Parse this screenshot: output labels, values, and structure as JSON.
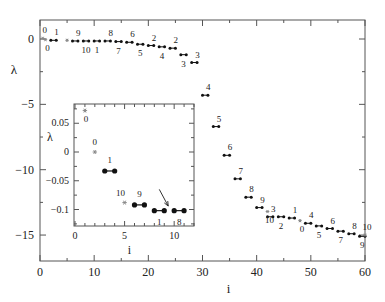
{
  "chart_data": [
    {
      "type": "scatter",
      "title": "",
      "xlabel": "i",
      "ylabel": "λ",
      "xlim": [
        0,
        60
      ],
      "ylim": [
        -17,
        1.5
      ],
      "x_ticks": [
        0,
        10,
        20,
        30,
        40,
        50,
        60
      ],
      "y_ticks": [
        0,
        -5,
        -10,
        -15
      ],
      "grid": false,
      "legend": null,
      "series": [
        {
          "name": "paired eigenvalues",
          "style": "black dumbbell pairs",
          "pairs": [
            {
              "x": [
                2,
                3
              ],
              "y": -0.1,
              "label": "1",
              "label_pos": "above"
            },
            {
              "x": [
                6,
                7
              ],
              "y": -0.15,
              "label": "9",
              "label_pos": "above"
            },
            {
              "x": [
                8,
                9
              ],
              "y": -0.15,
              "label": "10",
              "label_pos": "below"
            },
            {
              "x": [
                10,
                11
              ],
              "y": -0.15,
              "label": "1",
              "label_pos": "below"
            },
            {
              "x": [
                12,
                13
              ],
              "y": -0.15,
              "label": "8",
              "label_pos": "above"
            },
            {
              "x": [
                14,
                15
              ],
              "y": -0.2,
              "label": "7",
              "label_pos": "below"
            },
            {
              "x": [
                16,
                17
              ],
              "y": -0.25,
              "label": "6",
              "label_pos": "above"
            },
            {
              "x": [
                18,
                19
              ],
              "y": -0.4,
              "label": "5",
              "label_pos": "below"
            },
            {
              "x": [
                20,
                21
              ],
              "y": -0.5,
              "label": "2",
              "label_pos": "above"
            },
            {
              "x": [
                22,
                23
              ],
              "y": -0.6,
              "label": "4",
              "label_pos": "below"
            },
            {
              "x": [
                24,
                25
              ],
              "y": -0.7,
              "label": "2",
              "label_pos": "above"
            },
            {
              "x": [
                26,
                27
              ],
              "y": -1.2,
              "label": "3",
              "label_pos": "below"
            },
            {
              "x": [
                28,
                29
              ],
              "y": -1.8,
              "label": "3",
              "label_pos": "above"
            },
            {
              "x": [
                30,
                31
              ],
              "y": -4.3,
              "label": "4",
              "label_pos": "above"
            },
            {
              "x": [
                32,
                33
              ],
              "y": -6.7,
              "label": "5",
              "label_pos": "above"
            },
            {
              "x": [
                34,
                35
              ],
              "y": -8.9,
              "label": "6",
              "label_pos": "above"
            },
            {
              "x": [
                36,
                37
              ],
              "y": -10.7,
              "label": "7",
              "label_pos": "above"
            },
            {
              "x": [
                38,
                39
              ],
              "y": -12.1,
              "label": "8",
              "label_pos": "above"
            },
            {
              "x": [
                40,
                41
              ],
              "y": -12.9,
              "label": "9",
              "label_pos": "above"
            },
            {
              "x": [
                42,
                43
              ],
              "y": -13.6,
              "label": "3",
              "label_pos": "above"
            },
            {
              "x": [
                44,
                45
              ],
              "y": -13.6,
              "label": "2",
              "label_pos": "below"
            },
            {
              "x": [
                46,
                47
              ],
              "y": -13.7,
              "label": "1",
              "label_pos": "above"
            },
            {
              "x": [
                49,
                50
              ],
              "y": -14.1,
              "label": "4",
              "label_pos": "above"
            },
            {
              "x": [
                51,
                52
              ],
              "y": -14.3,
              "label": "5",
              "label_pos": "below"
            },
            {
              "x": [
                53,
                54
              ],
              "y": -14.5,
              "label": "6",
              "label_pos": "above"
            },
            {
              "x": [
                55,
                56
              ],
              "y": -14.7,
              "label": "7",
              "label_pos": "below"
            },
            {
              "x": [
                57,
                58
              ],
              "y": -14.9,
              "label": "8",
              "label_pos": "above"
            },
            {
              "x": [
                59,
                60
              ],
              "y": -15.1,
              "label": "9",
              "label_pos": "below"
            }
          ]
        },
        {
          "name": "single eigenvalues",
          "style": "gray star",
          "points": [
            {
              "x": 0.5,
              "y": 0.05,
              "label": "0",
              "label_pos": "above"
            },
            {
              "x": 1,
              "y": -0.05,
              "label": "0",
              "label_pos": "below"
            },
            {
              "x": 5,
              "y": -0.1,
              "label": "",
              "label_pos": "none"
            },
            {
              "x": 42,
              "y": -13.2,
              "label": "10",
              "label_pos": "below"
            },
            {
              "x": 48,
              "y": -13.9,
              "label": "0",
              "label_pos": "below"
            },
            {
              "x": 60,
              "y": -15.0,
              "label": "10",
              "label_pos": "above"
            }
          ]
        }
      ],
      "inset": {
        "type": "scatter",
        "xlabel": "i",
        "ylabel": "λ",
        "xlim": [
          0,
          12
        ],
        "ylim": [
          -0.128,
          0.085
        ],
        "x_ticks": [
          0,
          5,
          10
        ],
        "y_ticks": [
          0.05,
          0,
          -0.05,
          -0.1
        ],
        "y_tick_labels": [
          "0.05",
          "0",
          "−0.05",
          "−0.1"
        ],
        "single_points": [
          {
            "x": 1,
            "y": 0.072,
            "label": "0",
            "label_pos": "below-right"
          },
          {
            "x": 2,
            "y": 0.0,
            "label": "0",
            "label_pos": "above"
          },
          {
            "x": 5,
            "y": -0.088,
            "label": "10",
            "label_pos": "above"
          }
        ],
        "pairs": [
          {
            "x": [
              3,
              4
            ],
            "y": -0.033,
            "label": "1",
            "label_pos": "above"
          },
          {
            "x": [
              6,
              7
            ],
            "y": -0.092,
            "label": "9",
            "label_pos": "above"
          },
          {
            "x": [
              8,
              9
            ],
            "y": -0.102,
            "label": "1",
            "label_pos": "below"
          },
          {
            "x": [
              10,
              11
            ],
            "y": -0.102,
            "label": "8",
            "label_pos": "below"
          }
        ],
        "annotation": {
          "type": "arrow",
          "from": [
            8.5,
            -0.065
          ],
          "to": [
            9.4,
            -0.094
          ]
        }
      }
    }
  ],
  "axes": {
    "main_xlabel": "i",
    "main_ylabel": "λ",
    "main_x_tick_labels": [
      "0",
      "10",
      "20",
      "30",
      "40",
      "50",
      "60"
    ],
    "main_y_tick_labels": [
      "0",
      "−5",
      "−10",
      "−15"
    ],
    "inset_xlabel": "i",
    "inset_ylabel": "λ",
    "inset_x_tick_labels": [
      "0",
      "5",
      "10"
    ],
    "inset_y_tick_labels": [
      "0.05",
      "0",
      "−0.05",
      "−0.1"
    ]
  },
  "colors": {
    "axis": "#555555",
    "pair_marker": "#111111",
    "single_marker": "#888888",
    "text": "#222222"
  }
}
